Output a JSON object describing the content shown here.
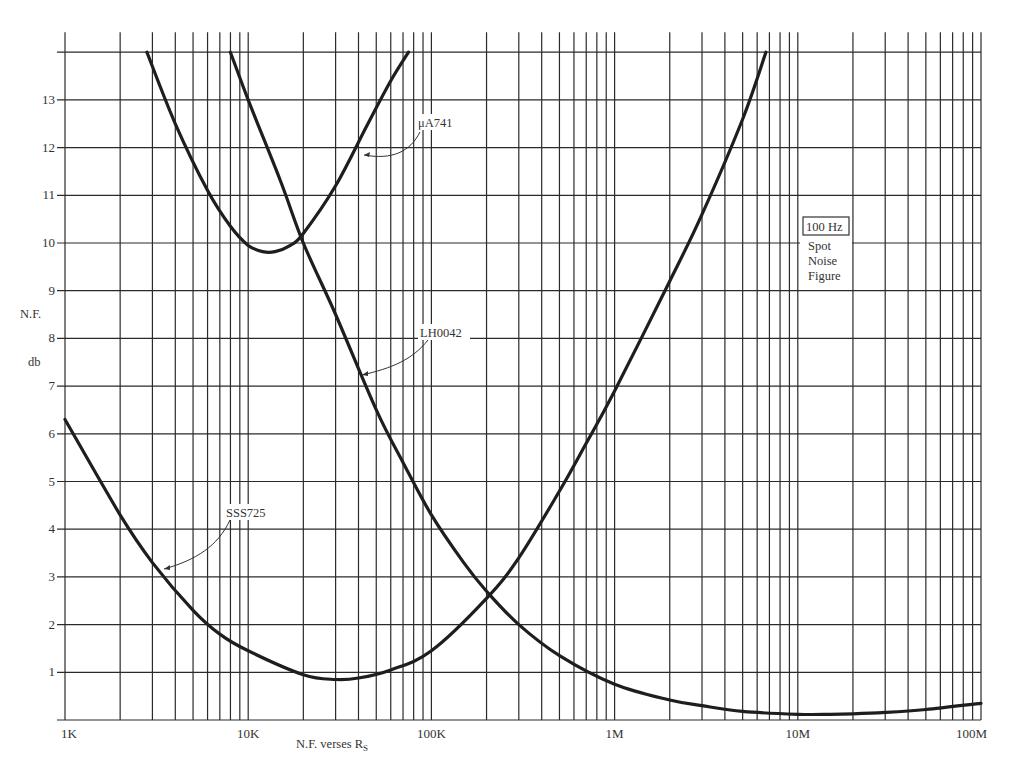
{
  "chart_data": {
    "type": "line",
    "title": "",
    "annotation": {
      "box": "100 Hz",
      "lines": [
        "Spot",
        "Noise",
        "Figure"
      ]
    },
    "xlabel": "N.F. verses Rs",
    "ylabel": [
      "N.F.",
      "db"
    ],
    "xscale": "log",
    "xlim": [
      1000,
      100000000
    ],
    "ylim": [
      0,
      14
    ],
    "grid": true,
    "x_tick_labels": [
      {
        "value": 1000,
        "label": "1K"
      },
      {
        "value": 10000,
        "label": "10K"
      },
      {
        "value": 100000,
        "label": "100K"
      },
      {
        "value": 1000000,
        "label": "1M"
      },
      {
        "value": 10000000,
        "label": "10M"
      },
      {
        "value": 100000000,
        "label": "100M"
      }
    ],
    "y_ticks": [
      1,
      2,
      3,
      4,
      5,
      6,
      7,
      8,
      9,
      10,
      11,
      12,
      13
    ],
    "series": [
      {
        "name": "μA741",
        "x": [
          2800,
          4000,
          6000,
          8000,
          10000,
          12000,
          14000,
          17000,
          20000,
          30000,
          45000,
          60000,
          75000
        ],
        "y": [
          14.0,
          12.5,
          11.1,
          10.35,
          9.95,
          9.82,
          9.82,
          9.95,
          10.2,
          11.2,
          12.5,
          13.4,
          14.0
        ]
      },
      {
        "name": "LH0042",
        "x": [
          8000,
          10000,
          15000,
          20000,
          30000,
          50000,
          70000,
          100000,
          150000,
          200000,
          300000,
          500000,
          1000000,
          2000000,
          3000000,
          5000000,
          10000000,
          15000000,
          20000000,
          30000000,
          50000000,
          100000000
        ],
        "y": [
          14.0,
          13.0,
          11.3,
          10.0,
          8.5,
          6.5,
          5.4,
          4.3,
          3.3,
          2.7,
          2.0,
          1.35,
          0.75,
          0.42,
          0.3,
          0.18,
          0.12,
          0.12,
          0.13,
          0.16,
          0.22,
          0.35
        ]
      },
      {
        "name": "SSS725",
        "x": [
          1000,
          2000,
          3000,
          5000,
          7000,
          10000,
          20000,
          30000,
          40000,
          60000,
          100000,
          200000,
          300000,
          500000,
          700000,
          1000000,
          2000000,
          3000000,
          5000000,
          6700000
        ],
        "y": [
          6.3,
          4.3,
          3.3,
          2.3,
          1.8,
          1.45,
          0.95,
          0.85,
          0.88,
          1.05,
          1.45,
          2.55,
          3.4,
          4.8,
          5.8,
          6.9,
          9.2,
          10.6,
          12.6,
          14.0
        ]
      }
    ],
    "curve_labels": [
      {
        "series": "μA741",
        "text": "μA741"
      },
      {
        "series": "LH0042",
        "text": "LH0042"
      },
      {
        "series": "SSS725",
        "text": "SSS725"
      }
    ]
  },
  "labels": {
    "y_title_1": "N.F.",
    "y_title_2": "db",
    "x_title": "N.F. verses R",
    "x_title_sub": "S",
    "note_box": "100 Hz",
    "note_1": "Spot",
    "note_2": "Noise",
    "note_3": "Figure",
    "ua741": "μA741",
    "lh0042": "LH0042",
    "sss725": "SSS725",
    "x_ticks": [
      "1K",
      "10K",
      "100K",
      "1M",
      "10M",
      "100M"
    ],
    "y_ticks": [
      "1",
      "2",
      "3",
      "4",
      "5",
      "6",
      "7",
      "8",
      "9",
      "10",
      "11",
      "12",
      "13"
    ]
  }
}
